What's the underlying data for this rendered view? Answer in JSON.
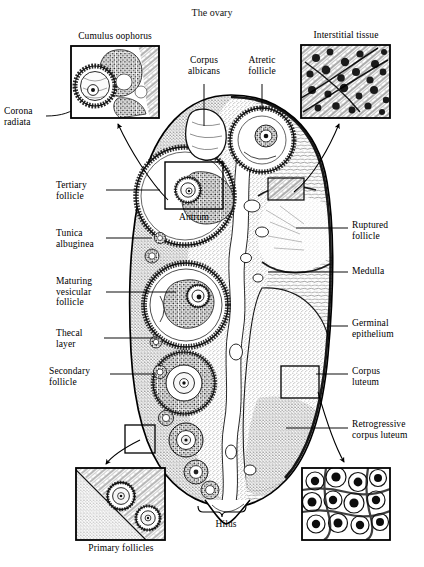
{
  "figure": {
    "title": "The ovary",
    "type": "anatomical-histology-diagram"
  },
  "insets": [
    {
      "id": "cumulus-oophorus",
      "caption": "Cumulus oophorus",
      "position": "top-left",
      "box": {
        "x": 71,
        "y": 46,
        "w": 88,
        "h": 72
      },
      "caption_pos": "above",
      "detail": "oocyte surrounded by granulosa cells within antrum"
    },
    {
      "id": "interstitial-tissue",
      "caption": "Interstitial tissue",
      "position": "top-right",
      "box": {
        "x": 301,
        "y": 45,
        "w": 89,
        "h": 73
      },
      "caption_pos": "above",
      "detail": "stromal interstitial cells with fibrous strands"
    },
    {
      "id": "primary-follicles",
      "caption": "Primary follicles",
      "position": "bottom-left",
      "box": {
        "x": 76,
        "y": 468,
        "w": 89,
        "h": 72
      },
      "caption_pos": "below",
      "detail": "two primary follicles in cortical stroma"
    },
    {
      "id": "corpus-luteum-cells",
      "caption": "",
      "position": "bottom-right",
      "box": {
        "x": 302,
        "y": 468,
        "w": 88,
        "h": 72
      },
      "caption_pos": "none",
      "detail": "luteal cells of retrogressive corpus luteum"
    }
  ],
  "labels": {
    "left": [
      {
        "id": "corona-radiata",
        "text": "Corona\nradiata",
        "x": 4,
        "y": 108,
        "align": "left"
      },
      {
        "id": "tertiary-follicle",
        "text": "Tertiary\nfollicle",
        "x": 57,
        "y": 180,
        "align": "left"
      },
      {
        "id": "tunica-albuginea",
        "text": "Tunica\nalbuginea",
        "x": 57,
        "y": 230,
        "align": "left"
      },
      {
        "id": "maturing-vesicular-follicle",
        "text": "Maturing\nvesicular\nfollicle",
        "x": 57,
        "y": 278,
        "align": "left"
      },
      {
        "id": "thecal-layer",
        "text": "Thecal\nlayer",
        "x": 57,
        "y": 330,
        "align": "left"
      },
      {
        "id": "secondary-follicle",
        "text": "Secondary\nfollicle",
        "x": 50,
        "y": 368,
        "align": "left"
      }
    ],
    "top": [
      {
        "id": "corpus-albicans",
        "text": "Corpus\nalbicans",
        "x": 183,
        "y": 56,
        "align": "center"
      },
      {
        "id": "atretic-follicle",
        "text": "Atretic\nfollicle",
        "x": 240,
        "y": 56,
        "align": "center"
      }
    ],
    "right": [
      {
        "id": "ruptured-follicle",
        "text": "Ruptured\nfollicle",
        "x": 352,
        "y": 220,
        "align": "left"
      },
      {
        "id": "medulla",
        "text": "Medulla",
        "x": 352,
        "y": 268,
        "align": "left"
      },
      {
        "id": "germinal-epithelium",
        "text": "Germinal\nepithelium",
        "x": 352,
        "y": 318,
        "align": "left"
      },
      {
        "id": "corpus-luteum",
        "text": "Corpus\nluteum",
        "x": 352,
        "y": 366,
        "align": "left"
      },
      {
        "id": "retrogressive-corpus-luteum",
        "text": "Retrogressive\ncorpus luteum",
        "x": 352,
        "y": 420,
        "align": "left"
      }
    ],
    "bottom": [
      {
        "id": "hilus",
        "text": "Hilus",
        "x": 220,
        "y": 518,
        "align": "center"
      }
    ]
  },
  "structures": {
    "ovary_outline": "oval cross-section, cortex at left with follicles, medulla and corpora lutea at right, hilus at inferior pole",
    "antrum_label": "Antrum",
    "callout_boxes": [
      {
        "id": "antrum-box",
        "x": 165,
        "y": 162,
        "w": 58,
        "h": 47,
        "links_to": "cumulus-oophorus"
      },
      {
        "id": "interstitial-box",
        "x": 268,
        "y": 178,
        "w": 36,
        "h": 22,
        "links_to": "interstitial-tissue"
      },
      {
        "id": "corpus-luteum-box",
        "x": 281,
        "y": 366,
        "w": 38,
        "h": 32,
        "links_to": "corpus-luteum-cells"
      },
      {
        "id": "primary-follicle-box",
        "x": 125,
        "y": 425,
        "w": 30,
        "h": 28,
        "links_to": "primary-follicles"
      }
    ]
  },
  "colors": {
    "ink": "#1a1a1a",
    "background": "#ffffff",
    "stroke": "#000000",
    "tissue_fill": "#f2f2f2"
  }
}
